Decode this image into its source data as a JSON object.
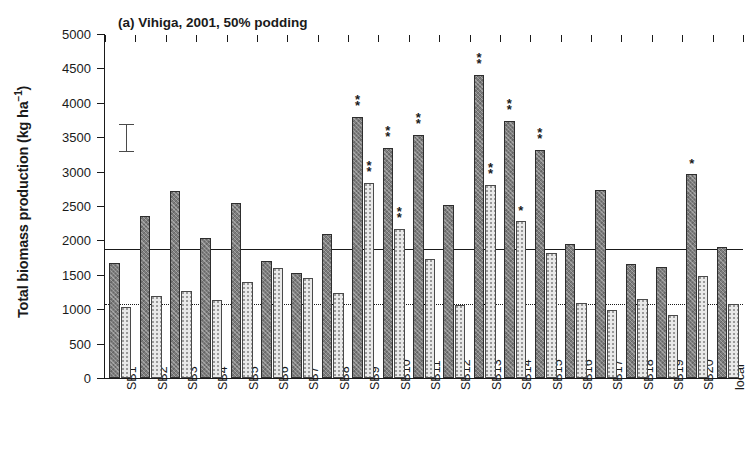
{
  "figure": {
    "panel_label": "(a)",
    "title": "(a) Vihiga, 2001, 50% podding",
    "ylabel_text": "Total biomass production (kg ha",
    "ylabel_exponent": "−1",
    "ylabel_close": ")"
  },
  "axes": {
    "y_ticks": [
      "5000",
      "4500",
      "4000",
      "3500",
      "3000",
      "2500",
      "2000",
      "1500",
      "1000",
      "500",
      "0"
    ],
    "y_min": 0,
    "y_max": 5000,
    "y_step": 500,
    "grid": false
  },
  "annotations": {
    "lsd_label": "lsd-error-bar",
    "lsd_low": 3290,
    "lsd_high": 3690,
    "reference_line_solid": 1880,
    "reference_line_dotted": 1080
  },
  "chart_data": {
    "type": "bar",
    "title": "(a) Vihiga, 2001, 50% podding",
    "xlabel": "",
    "ylabel": "Total biomass production (kg ha−1)",
    "ylim": [
      0,
      5000
    ],
    "ytick_step": 500,
    "grid": false,
    "legend": [],
    "categories": [
      "SB1",
      "SB2",
      "SB3",
      "SB4",
      "SB5",
      "SB6",
      "SB7",
      "SB8",
      "SB9",
      "SB10",
      "SB11",
      "SB12",
      "SB13",
      "SB14",
      "SB15",
      "SB16",
      "SB17",
      "SB18",
      "SB19",
      "SB20",
      "local"
    ],
    "series": [
      {
        "name": "series-1",
        "style": "dark-hatched",
        "values": [
          1670,
          2350,
          2720,
          2040,
          2550,
          1700,
          1530,
          2100,
          3790,
          3350,
          3530,
          2520,
          4410,
          3730,
          3310,
          1950,
          2740,
          1660,
          1620,
          2960,
          1910
        ]
      },
      {
        "name": "series-2",
        "style": "light-dotted",
        "values": [
          1030,
          1190,
          1270,
          1130,
          1400,
          1600,
          1450,
          1230,
          2830,
          2170,
          1730,
          1060,
          2810,
          2280,
          1810,
          1090,
          990,
          1150,
          910,
          1490,
          1080
        ]
      }
    ],
    "significance": [
      {
        "category": "SB9",
        "series": 1,
        "mark": "**"
      },
      {
        "category": "SB9",
        "series": 2,
        "mark": "**"
      },
      {
        "category": "SB10",
        "series": 1,
        "mark": "**"
      },
      {
        "category": "SB10",
        "series": 2,
        "mark": "**"
      },
      {
        "category": "SB11",
        "series": 1,
        "mark": "**"
      },
      {
        "category": "SB13",
        "series": 1,
        "mark": "**"
      },
      {
        "category": "SB13",
        "series": 2,
        "mark": "**"
      },
      {
        "category": "SB14",
        "series": 1,
        "mark": "**"
      },
      {
        "category": "SB14",
        "series": 2,
        "mark": "*"
      },
      {
        "category": "SB15",
        "series": 1,
        "mark": "**"
      },
      {
        "category": "SB20",
        "series": 1,
        "mark": "*"
      }
    ],
    "reference_lines": [
      {
        "value": 1880,
        "style": "solid"
      },
      {
        "value": 1080,
        "style": "dotted"
      }
    ],
    "error_indicator": {
      "low": 3290,
      "high": 3690
    }
  }
}
